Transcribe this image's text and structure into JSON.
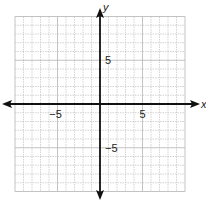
{
  "chart_data": {
    "type": "scatter",
    "title": "",
    "xlabel": "x",
    "ylabel": "y",
    "xlim": [
      -10,
      10
    ],
    "ylim": [
      -10,
      10
    ],
    "grid": true,
    "grid_step": 1,
    "major_grid_step": 5,
    "x_ticks": [
      {
        "value": -5,
        "label": "−5"
      },
      {
        "value": 5,
        "label": "5"
      }
    ],
    "y_ticks": [
      {
        "value": 5,
        "label": "5"
      },
      {
        "value": -5,
        "label": "−5"
      }
    ],
    "points": [],
    "colors": {
      "axis": "#111111",
      "grid_minor": "#c8c8c8",
      "grid_major": "#b4b4b4",
      "text": "#222222"
    }
  }
}
